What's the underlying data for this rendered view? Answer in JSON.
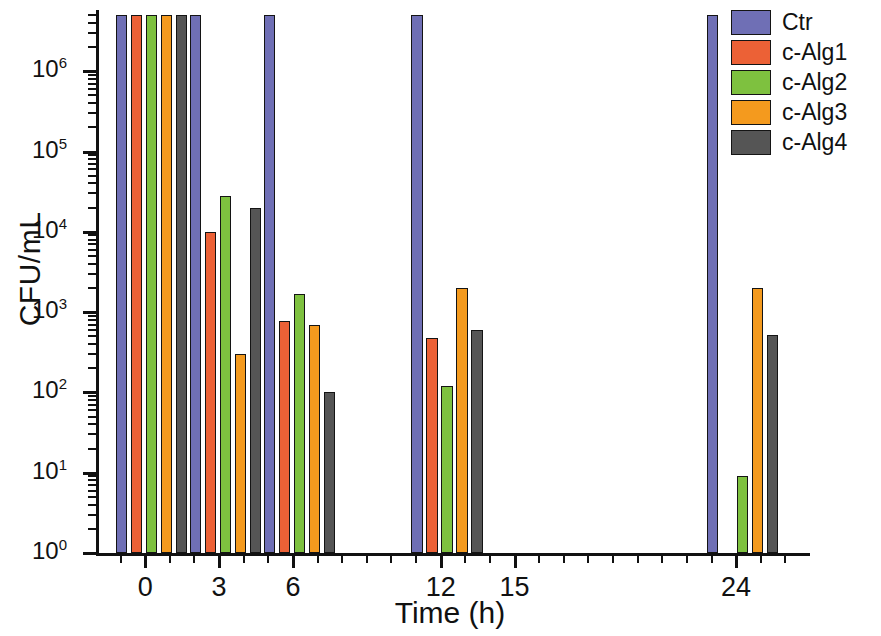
{
  "chart_data": {
    "type": "bar",
    "title": "",
    "xlabel": "Time (h)",
    "ylabel": "CFU/mL",
    "yscale": "log",
    "ylim": [
      1,
      5000000
    ],
    "ytick_labels": [
      "10⁰",
      "10¹",
      "10²",
      "10³",
      "10⁴",
      "10⁵",
      "10⁶"
    ],
    "ytick_values": [
      1,
      10,
      100,
      1000,
      10000,
      100000,
      1000000
    ],
    "xtick_labels": [
      "0",
      "3",
      "6",
      "12",
      "15",
      "24"
    ],
    "xtick_values": [
      0,
      3,
      6,
      12,
      15,
      24
    ],
    "xlim": [
      -2,
      27
    ],
    "grid": false,
    "legend_position": "right-top",
    "categories": [
      "0",
      "3",
      "6",
      "12",
      "24"
    ],
    "series": [
      {
        "name": "Ctr",
        "color": "#6f6fb5",
        "values": [
          5000000,
          5000000,
          5000000,
          5000000,
          5000000
        ]
      },
      {
        "name": "c-Alg1",
        "color": "#ec6136",
        "values": [
          5000000,
          10000,
          770,
          480,
          0
        ]
      },
      {
        "name": "c-Alg2",
        "color": "#7ec13f",
        "values": [
          5000000,
          28000,
          1700,
          120,
          9
        ]
      },
      {
        "name": "c-Alg3",
        "color": "#f49a1e",
        "values": [
          5000000,
          300,
          700,
          2000,
          2000
        ]
      },
      {
        "name": "c-Alg4",
        "color": "#555555",
        "values": [
          5000000,
          20000,
          100,
          600,
          520
        ]
      }
    ]
  },
  "legend": {
    "items": [
      {
        "label": "Ctr",
        "color": "#6f6fb5"
      },
      {
        "label": "c-Alg1",
        "color": "#ec6136"
      },
      {
        "label": "c-Alg2",
        "color": "#7ec13f"
      },
      {
        "label": "c-Alg3",
        "color": "#f49a1e"
      },
      {
        "label": "c-Alg4",
        "color": "#555555"
      }
    ]
  },
  "axes": {
    "y": {
      "label": "CFU/mL",
      "ticks": [
        {
          "label_base": "10",
          "label_exp": "0",
          "value": 1
        },
        {
          "label_base": "10",
          "label_exp": "1",
          "value": 10
        },
        {
          "label_base": "10",
          "label_exp": "2",
          "value": 100
        },
        {
          "label_base": "10",
          "label_exp": "3",
          "value": 1000
        },
        {
          "label_base": "10",
          "label_exp": "4",
          "value": 10000
        },
        {
          "label_base": "10",
          "label_exp": "5",
          "value": 100000
        },
        {
          "label_base": "10",
          "label_exp": "6",
          "value": 1000000
        }
      ]
    },
    "x": {
      "label": "Time (h)",
      "ticks": [
        {
          "label": "0",
          "value": 0
        },
        {
          "label": "3",
          "value": 3
        },
        {
          "label": "6",
          "value": 6
        },
        {
          "label": "12",
          "value": 12
        },
        {
          "label": "15",
          "value": 15
        },
        {
          "label": "24",
          "value": 24
        }
      ]
    }
  }
}
